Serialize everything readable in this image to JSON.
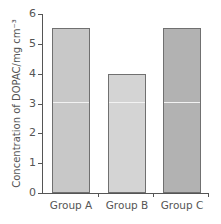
{
  "chart_data": {
    "type": "bar",
    "title": "",
    "xlabel": "",
    "ylabel": "Concentration of DOPAC/mg cm⁻³",
    "categories": [
      "Group A",
      "Group B",
      "Group C"
    ],
    "values": [
      5.55,
      4.0,
      5.55
    ],
    "ylim": [
      0,
      6
    ],
    "yticks": [
      "0",
      "1",
      "2",
      "3",
      "4",
      "5",
      "6"
    ],
    "grid": false,
    "legend": null,
    "bar_colors": [
      "#c8c8c8",
      "#d4d4d4",
      "#b2b2b2"
    ]
  }
}
